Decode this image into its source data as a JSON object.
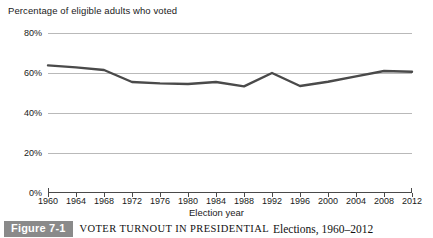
{
  "chart_data": {
    "type": "line",
    "ylabel": "Percentage of eligible adults who voted",
    "xlabel": "Election year",
    "categories": [
      1960,
      1964,
      1968,
      1972,
      1976,
      1980,
      1984,
      1988,
      1992,
      1996,
      2000,
      2004,
      2008,
      2012
    ],
    "tick_labels": [
      "1960",
      "1964",
      "1968",
      "1972",
      "1976",
      "1980",
      "1984",
      "1988",
      "1992",
      "1996",
      "2000",
      "2004",
      "2008",
      "2012"
    ],
    "values": [
      63.8,
      62.8,
      61.5,
      55.5,
      54.8,
      54.5,
      55.5,
      53.3,
      60.0,
      53.5,
      55.6,
      58.3,
      61.0,
      60.6
    ],
    "y_tick_labels": [
      "0%",
      "20%",
      "40%",
      "60%",
      "80%"
    ],
    "y_tick_values": [
      0,
      20,
      40,
      60,
      80
    ],
    "ylim": [
      0,
      80
    ],
    "grid": true,
    "legend": "none",
    "line_color": "#4a4a4a",
    "grid_color": "#b9b9b9"
  },
  "axis_note": "Percentage of eligible adults who voted",
  "xaxis_title": "Election year",
  "caption": {
    "figure_number": "Figure 7-1",
    "title_smallcaps": "VOTER TURNOUT IN PRESIDENTIAL",
    "title_rest": "Elections, 1960–2012",
    "badge_color": "#8a8a8a"
  }
}
